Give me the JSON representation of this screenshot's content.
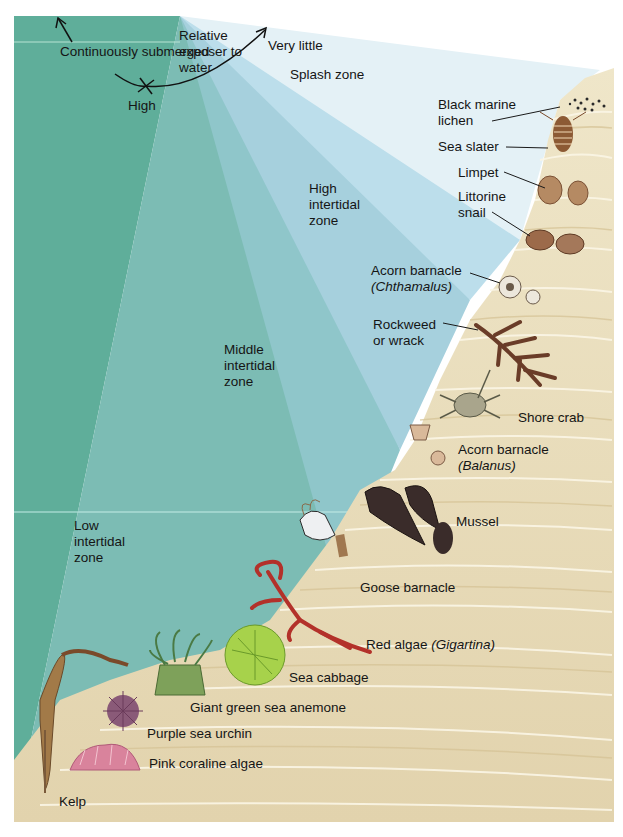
{
  "diagram": {
    "type": "intertidal zonation illustration",
    "exposure_axis": {
      "title": "Relative exposer to water",
      "left_end": "Continuously submerged",
      "center": "High",
      "right_end": "Very little"
    },
    "zones": [
      {
        "id": "splash",
        "label": "Splash zone"
      },
      {
        "id": "high",
        "label": "High\nintertidal\nzone"
      },
      {
        "id": "middle",
        "label": "Middle\nintertidal\nzone"
      },
      {
        "id": "low",
        "label": "Low\nintertidal\nzone"
      }
    ],
    "organisms": [
      {
        "label": "Black marine\nlichen"
      },
      {
        "label": "Sea slater"
      },
      {
        "label": "Limpet"
      },
      {
        "label": "Littorine\nsnail"
      },
      {
        "label": "Acorn barnacle",
        "sci": "(Chthamalus)"
      },
      {
        "label": "Rockweed\nor wrack"
      },
      {
        "label": "Shore crab"
      },
      {
        "label": "Acorn barnacle",
        "sci": "(Balanus)"
      },
      {
        "label": "Mussel"
      },
      {
        "label": "Goose barnacle"
      },
      {
        "label": "Red algae ",
        "sci": "(Gigartina)"
      },
      {
        "label": "Sea cabbage"
      },
      {
        "label": "Giant green sea anemone"
      },
      {
        "label": "Purple sea urchin"
      },
      {
        "label": "Pink coraline algae"
      },
      {
        "label": "Kelp"
      }
    ],
    "colors": {
      "deep_water": "#5fae9a",
      "low_zone": "#86c2c4",
      "mid_zone": "#9ccbd8",
      "high_zone": "#b9dceb",
      "splash_zone": "#e3f0f6",
      "rock": "#e8dcb8",
      "rock_line": "#fbf6e6",
      "rock_shadow": "#d5c294"
    }
  }
}
